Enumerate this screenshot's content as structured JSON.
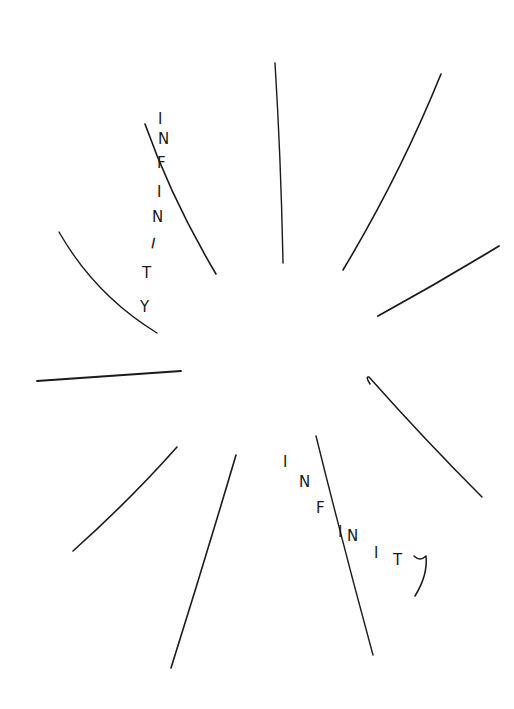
{
  "drawing": {
    "title": "",
    "background": "#ffffff",
    "ink": "#1a1a1a",
    "words": [
      {
        "text": "INFINITY",
        "letters": [
          "I",
          "N",
          "F",
          "I",
          "N",
          "I",
          "T",
          "Y"
        ]
      },
      {
        "text": "INFINITY",
        "letters": [
          "I",
          "N",
          "F",
          "I",
          "N",
          "I",
          "T",
          "Y"
        ]
      }
    ],
    "rays": [
      {
        "name": "ray-top-left",
        "d": "M145 124 Q175 200 216 274"
      },
      {
        "name": "ray-top",
        "d": "M275 63 Q280 160 283 263"
      },
      {
        "name": "ray-top-right",
        "d": "M441 74 Q395 180 343 270"
      },
      {
        "name": "ray-right",
        "d": "M499 246 Q440 280 378 316"
      },
      {
        "name": "ray-left-upper",
        "d": "M59 232 Q100 290 157 333"
      },
      {
        "name": "ray-left",
        "d": "M37 381 Q110 377 181 372"
      },
      {
        "name": "ray-right-lower",
        "d": "M371 379 Q366 375 370 378 Q425 440 482 497"
      },
      {
        "name": "ray-bottom-left",
        "d": "M73 551 Q125 500 177 447"
      },
      {
        "name": "ray-bottom-center-left",
        "d": "M236 455 Q200 560 171 668"
      },
      {
        "name": "ray-bottom-center-right",
        "d": "M316 436 Q345 545 373 655"
      }
    ]
  }
}
